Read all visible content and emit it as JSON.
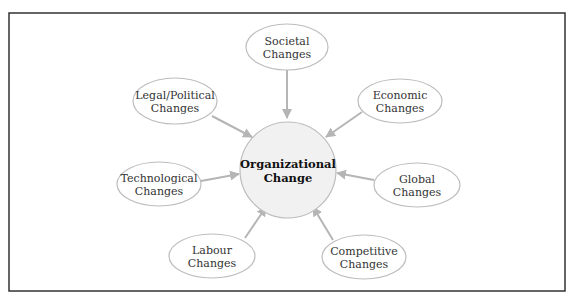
{
  "diagram": {
    "title": "Organizational Change",
    "colors": {
      "frame": "#333333",
      "ellipse_stroke": "#bdbdbd",
      "ellipse_fill": "#ffffff",
      "center_fill": "#f1f1f1",
      "center_stroke": "#bdbdbd",
      "arrow": "#b5b5b5",
      "text": "#333333"
    },
    "center": {
      "line1": "Organizational",
      "line2": "Change"
    },
    "nodes": [
      {
        "id": "societal",
        "line1": "Societal",
        "line2": "Changes"
      },
      {
        "id": "legal-political",
        "line1": "Legal/Political",
        "line2": "Changes"
      },
      {
        "id": "economic",
        "line1": "Economic",
        "line2": "Changes"
      },
      {
        "id": "technological",
        "line1": "Technological",
        "line2": "Changes"
      },
      {
        "id": "global",
        "line1": "Global",
        "line2": "Changes"
      },
      {
        "id": "labour",
        "line1": "Labour",
        "line2": "Changes"
      },
      {
        "id": "competitive",
        "line1": "Competitive",
        "line2": "Changes"
      }
    ]
  }
}
